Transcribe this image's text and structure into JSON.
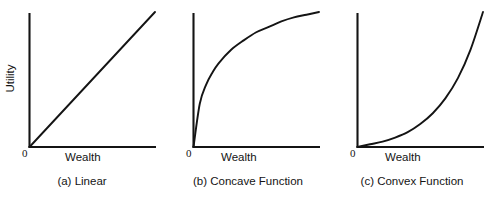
{
  "figure": {
    "background_color": "#ffffff",
    "ink_color": "#141414"
  },
  "panels": [
    {
      "id": "a",
      "caption": "(a) Linear",
      "xlabel": "Wealth",
      "ylabel": "Utility",
      "origin_label": "0",
      "curve_type": "linear"
    },
    {
      "id": "b",
      "caption": "(b) Concave Function",
      "xlabel": "Wealth",
      "ylabel": "",
      "origin_label": "0",
      "curve_type": "concave"
    },
    {
      "id": "c",
      "caption": "(c) Convex Function",
      "xlabel": "Wealth",
      "ylabel": "",
      "origin_label": "0",
      "curve_type": "convex"
    }
  ],
  "chart_data": [
    {
      "type": "line",
      "title": "(a) Linear",
      "xlabel": "Wealth",
      "ylabel": "Utility",
      "xlim": [
        0,
        1
      ],
      "ylim": [
        0,
        1
      ],
      "grid": false,
      "legend": "none",
      "annotations": [
        "0"
      ],
      "series": [
        {
          "name": "Linear utility",
          "x": [
            0.0,
            0.1,
            0.2,
            0.3,
            0.4,
            0.5,
            0.6,
            0.7,
            0.8,
            0.9,
            1.0
          ],
          "values": [
            0.0,
            0.1,
            0.2,
            0.3,
            0.4,
            0.5,
            0.6,
            0.7,
            0.8,
            0.9,
            1.0
          ]
        }
      ]
    },
    {
      "type": "line",
      "title": "(b) Concave Function",
      "xlabel": "Wealth",
      "ylabel": "",
      "xlim": [
        0,
        1
      ],
      "ylim": [
        0,
        1
      ],
      "grid": false,
      "legend": "none",
      "annotations": [
        "0"
      ],
      "series": [
        {
          "name": "Concave utility",
          "x": [
            0.0,
            0.05,
            0.1,
            0.15,
            0.2,
            0.3,
            0.4,
            0.5,
            0.6,
            0.7,
            0.8,
            0.9,
            1.0
          ],
          "values": [
            0.0,
            0.32,
            0.46,
            0.55,
            0.62,
            0.72,
            0.79,
            0.85,
            0.89,
            0.93,
            0.96,
            0.98,
            1.0
          ]
        }
      ]
    },
    {
      "type": "line",
      "title": "(c) Convex Function",
      "xlabel": "Wealth",
      "ylabel": "",
      "xlim": [
        0,
        1
      ],
      "ylim": [
        0,
        1
      ],
      "grid": false,
      "legend": "none",
      "annotations": [
        "0"
      ],
      "series": [
        {
          "name": "Convex utility",
          "x": [
            0.0,
            0.1,
            0.2,
            0.3,
            0.4,
            0.5,
            0.6,
            0.7,
            0.8,
            0.9,
            1.0
          ],
          "values": [
            0.0,
            0.02,
            0.04,
            0.07,
            0.11,
            0.17,
            0.25,
            0.36,
            0.51,
            0.72,
            1.0
          ]
        }
      ]
    }
  ]
}
